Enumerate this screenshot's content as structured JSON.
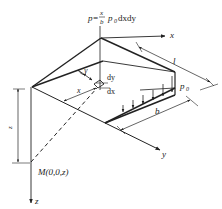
{
  "diagram": {
    "formula": {
      "lhs": "p=",
      "frac_num": "x",
      "frac_den": "b",
      "rhs": "p",
      "rhs_sub": "0",
      "rhs_tail": "dxdy"
    },
    "labels": {
      "x_axis": "x",
      "y_axis": "y",
      "z_axis": "z",
      "length": "l",
      "width": "b",
      "p0": "p",
      "p0_sub": "0",
      "dy": "dy",
      "dx": "dx",
      "x_dim": "x",
      "y_angle": "y",
      "z_dim": "z",
      "point_M": "M(0,0,z)"
    },
    "colors": {
      "stroke": "#222222",
      "background": "#ffffff"
    }
  }
}
